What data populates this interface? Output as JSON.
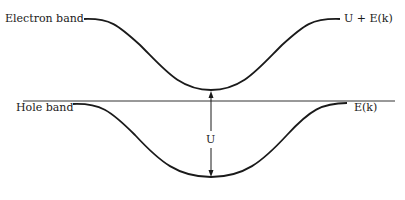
{
  "diagram": {
    "labels": {
      "electron_band": "Electron band",
      "electron_band_energy": "U + E(k)",
      "hole_band": "Hole band",
      "hole_band_energy": "E(k)",
      "gap": "U"
    },
    "colors": {
      "ink": "#1a1a1a",
      "background": "#ffffff"
    }
  }
}
